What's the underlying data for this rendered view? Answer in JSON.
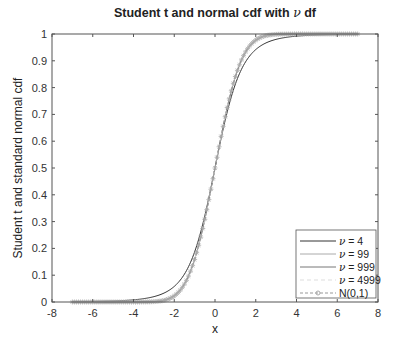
{
  "chart_data": {
    "type": "line",
    "title": "Student t and normal cdf with ν df",
    "title_prefix": "Student t and normal cdf with ",
    "title_symbol": "ν",
    "title_suffix": " df",
    "xlabel": "x",
    "ylabel": "Student t and standard normal cdf",
    "xlim": [
      -8,
      8
    ],
    "ylim": [
      0,
      1
    ],
    "xticks": [
      -8,
      -6,
      -4,
      -2,
      0,
      2,
      4,
      6,
      8
    ],
    "yticks": [
      0,
      0.1,
      0.2,
      0.3,
      0.4,
      0.5,
      0.6,
      0.7,
      0.8,
      0.9,
      1
    ],
    "ytick_labels": [
      "0",
      "0.1",
      "0.2",
      "0.3",
      "0.4",
      "0.5",
      "0.6",
      "0.7",
      "0.8",
      "0.9",
      "1"
    ],
    "grid": false,
    "legend_position": "southeast",
    "x_domain": [
      -7,
      7
    ],
    "series": [
      {
        "name": "ν = 4",
        "label_symbol": "ν",
        "label_rest": " = 4",
        "df": 4,
        "color": "#333333",
        "width": 1,
        "dash": "",
        "marker": "none"
      },
      {
        "name": "ν = 99",
        "label_symbol": "ν",
        "label_rest": " = 99",
        "df": 99,
        "color": "#aaaaaa",
        "width": 1,
        "dash": "",
        "marker": "none"
      },
      {
        "name": "ν = 999",
        "label_symbol": "ν",
        "label_rest": " = 999",
        "df": 999,
        "color": "#777777",
        "width": 1,
        "dash": "",
        "marker": "none"
      },
      {
        "name": "ν = 4999",
        "label_symbol": "ν",
        "label_rest": " = 4999",
        "df": 4999,
        "color": "#dddddd",
        "width": 1,
        "dash": "4,3",
        "marker": "none"
      },
      {
        "name": "N(0,1)",
        "label_symbol": "",
        "label_rest": "N(0,1)",
        "df": null,
        "color": "#999999",
        "width": 1,
        "dash": "3,2",
        "marker": "star"
      }
    ],
    "sample_values": {
      "x": [
        -7,
        -4,
        -2,
        -1,
        0,
        1,
        2,
        4,
        7
      ],
      "t4": [
        0.001,
        0.008,
        0.058,
        0.187,
        0.5,
        0.813,
        0.942,
        0.992,
        0.999
      ],
      "normal": [
        0.0,
        3e-05,
        0.023,
        0.159,
        0.5,
        0.841,
        0.977,
        0.99997,
        1.0
      ]
    }
  }
}
